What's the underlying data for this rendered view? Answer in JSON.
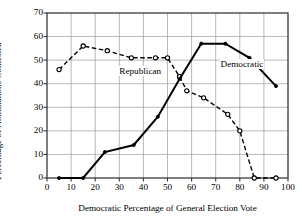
{
  "chart_data": {
    "type": "line",
    "title": "",
    "xlabel": "Democratic Percentage of General Election Vote",
    "ylabel": "Percentage of Nominations Contested",
    "xlim": [
      0,
      100
    ],
    "ylim": [
      0,
      70
    ],
    "xticks": [
      0,
      10,
      20,
      30,
      40,
      50,
      60,
      70,
      80,
      90,
      100
    ],
    "yticks": [
      0,
      10,
      20,
      30,
      40,
      50,
      60,
      70
    ],
    "grid": true,
    "legend_position": "inline-annotation",
    "series": [
      {
        "name": "Republican",
        "style": "dashed",
        "marker": "open-circle",
        "annotation": "Republican",
        "points": [
          {
            "x": 5,
            "y": 46
          },
          {
            "x": 15,
            "y": 56
          },
          {
            "x": 25,
            "y": 54
          },
          {
            "x": 35,
            "y": 51
          },
          {
            "x": 45,
            "y": 51
          },
          {
            "x": 50,
            "y": 51
          },
          {
            "x": 55,
            "y": 43
          },
          {
            "x": 58,
            "y": 37
          },
          {
            "x": 65,
            "y": 34
          },
          {
            "x": 75,
            "y": 27
          },
          {
            "x": 80,
            "y": 20
          },
          {
            "x": 86,
            "y": 0
          },
          {
            "x": 95,
            "y": 0
          }
        ]
      },
      {
        "name": "Democratic",
        "style": "solid",
        "marker": "filled",
        "annotation": "Democratic",
        "points": [
          {
            "x": 5,
            "y": 0
          },
          {
            "x": 15,
            "y": 0
          },
          {
            "x": 24,
            "y": 11
          },
          {
            "x": 36,
            "y": 14
          },
          {
            "x": 46,
            "y": 26
          },
          {
            "x": 55,
            "y": 42
          },
          {
            "x": 64,
            "y": 57
          },
          {
            "x": 74,
            "y": 57
          },
          {
            "x": 84,
            "y": 51
          },
          {
            "x": 95,
            "y": 39
          }
        ]
      }
    ],
    "annotations": [
      {
        "text": "Republican",
        "x": 30,
        "y": 45
      },
      {
        "text": "Democratic",
        "x": 72,
        "y": 48
      }
    ]
  }
}
